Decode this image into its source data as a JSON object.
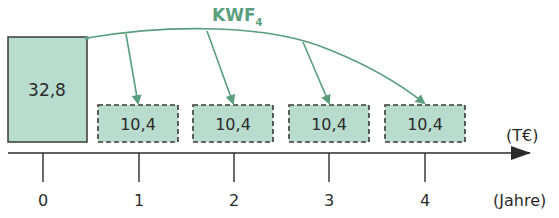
{
  "title": {
    "main": "KWF",
    "subscript": "4",
    "color": "#5a9e7e"
  },
  "colors": {
    "box_fill": "#b8dccd",
    "box_border": "#3a3a3a",
    "arrow": "#5a9e7e",
    "axis": "#2b2b2b"
  },
  "initial_box": {
    "value": "32,8",
    "year": 0
  },
  "payment_boxes": [
    {
      "value": "10,4",
      "year": 1
    },
    {
      "value": "10,4",
      "year": 2
    },
    {
      "value": "10,4",
      "year": 3
    },
    {
      "value": "10,4",
      "year": 4
    }
  ],
  "axis": {
    "ticks": [
      "0",
      "1",
      "2",
      "3",
      "4"
    ],
    "value_unit": "(T€)",
    "time_unit": "(Jahre)"
  }
}
